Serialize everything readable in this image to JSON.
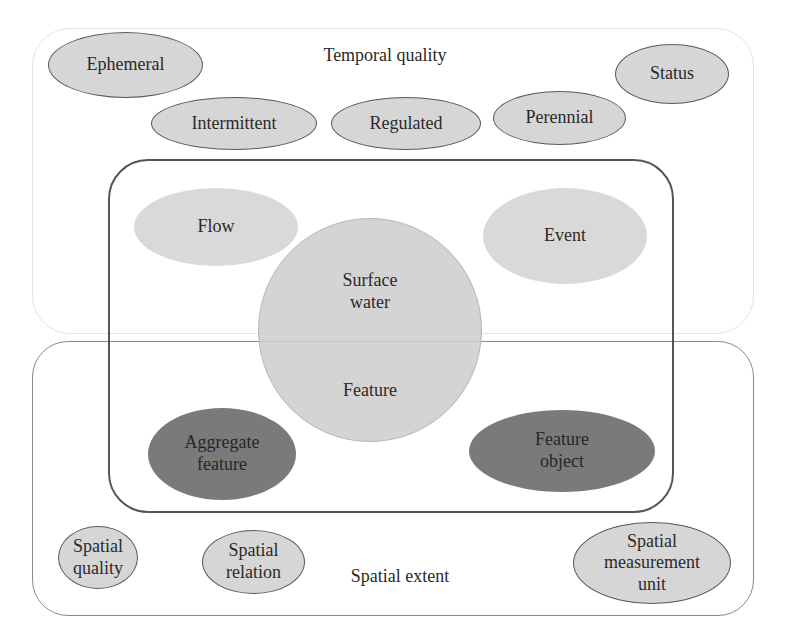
{
  "diagram": {
    "temporal_group": {
      "title": "Temporal quality",
      "items": [
        "Ephemeral",
        "Intermittent",
        "Regulated",
        "Perennial",
        "Status"
      ]
    },
    "core_group": {
      "center": {
        "top_label": "Surface\nwater",
        "bottom_label": "Feature"
      },
      "items": {
        "flow": "Flow",
        "event": "Event",
        "aggregate_feature": "Aggregate\nfeature",
        "feature_object": "Feature\nobject"
      }
    },
    "spatial_group": {
      "title": "Spatial extent",
      "items": [
        "Spatial\nquality",
        "Spatial\nrelation",
        "Spatial\nmeasurement\nunit"
      ]
    },
    "colors": {
      "light_fill": "#d9d9d9",
      "dark_fill": "#7a7a7a",
      "outline": "#5a5a5a"
    }
  }
}
